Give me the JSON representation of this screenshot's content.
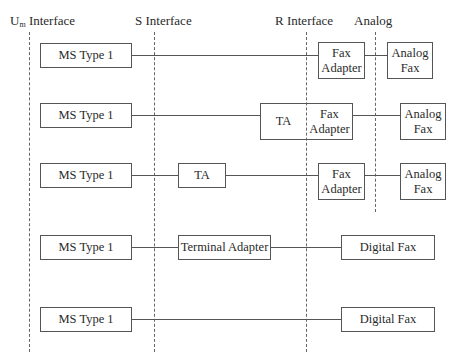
{
  "interfaces": {
    "um": {
      "main": "U",
      "sub": "m",
      "suffix": " Interface"
    },
    "s": "S Interface",
    "r": "R Interface",
    "analog": "Analog"
  },
  "rows": [
    {
      "ms": "MS Type 1",
      "fax_adapter": "Fax\nAdapter",
      "terminal": "Analog\nFax"
    },
    {
      "ms": "MS Type 1",
      "ta": "TA",
      "fax_adapter": "Fax\nAdapter",
      "terminal": "Analog\nFax"
    },
    {
      "ms": "MS Type 1",
      "ta": "TA",
      "fax_adapter": "Fax\nAdapter",
      "terminal": "Analog\nFax"
    },
    {
      "ms": "MS Type 1",
      "terminal_adapter": "Terminal Adapter",
      "terminal": "Digital Fax"
    },
    {
      "ms": "MS Type 1",
      "terminal": "Digital Fax"
    }
  ]
}
